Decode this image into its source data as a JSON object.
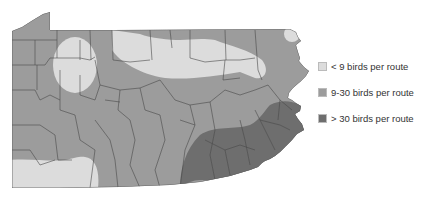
{
  "map": {
    "region": "Pennsylvania",
    "colors": {
      "low": "#dcdcdc",
      "mid": "#9c9c9c",
      "high": "#6e6e6e",
      "border": "#4a4a4a"
    }
  },
  "legend": {
    "items": [
      {
        "label": "< 9 birds per route",
        "color": "#dcdcdc"
      },
      {
        "label": "9-30 birds per route",
        "color": "#9c9c9c"
      },
      {
        "label": "> 30 birds per route",
        "color": "#6e6e6e"
      }
    ]
  }
}
